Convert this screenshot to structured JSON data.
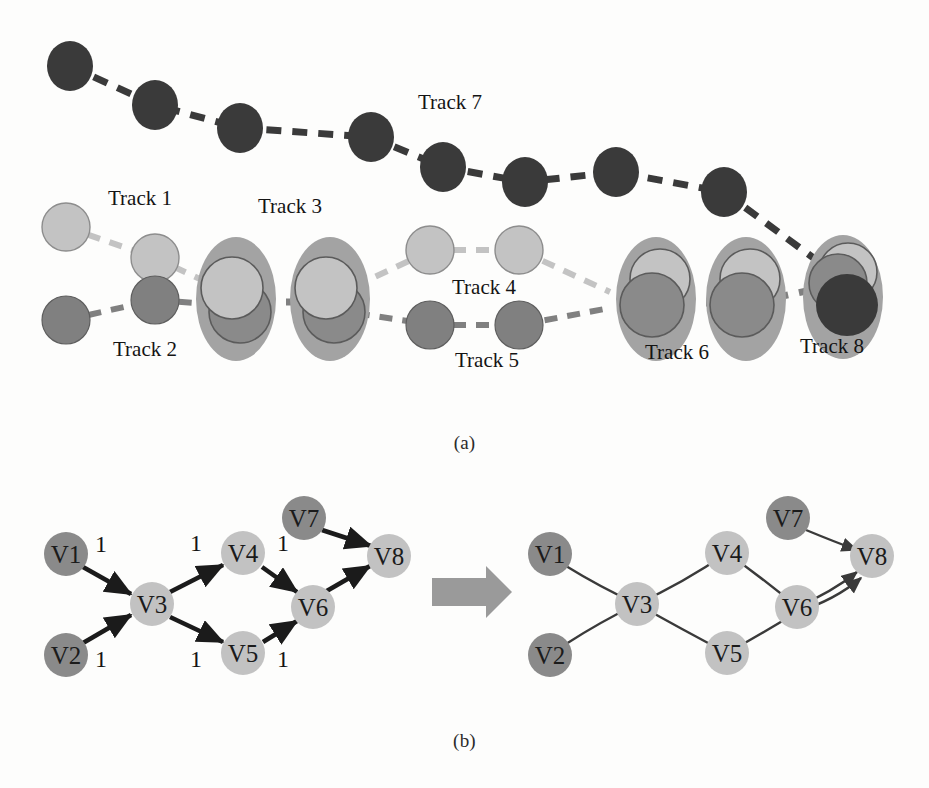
{
  "figure": {
    "panel_a_caption": "(a)",
    "panel_b_caption": "(b)",
    "background_color": "#fdfdfc"
  },
  "colors": {
    "track_dark": "#3a3a3a",
    "track_medium": "#808080",
    "track_light": "#c3c3c3",
    "group_ellipse": "#a0a0a0",
    "node_dark": "#8a8a8a",
    "node_light": "#c2c2c2",
    "edge_black": "#1b1b1b",
    "arrow_block": "#9a9a9a",
    "outline": "#555555"
  },
  "panel_a": {
    "labels": [
      {
        "text": "Track 1",
        "x": 108,
        "y": 186
      },
      {
        "text": "Track 2",
        "x": 113,
        "y": 337
      },
      {
        "text": "Track 3",
        "x": 258,
        "y": 194
      },
      {
        "text": "Track 4",
        "x": 452,
        "y": 275
      },
      {
        "text": "Track 5",
        "x": 455,
        "y": 348
      },
      {
        "text": "Track 6",
        "x": 645,
        "y": 340
      },
      {
        "text": "Track 7",
        "x": 418,
        "y": 90
      },
      {
        "text": "Track 8",
        "x": 800,
        "y": 334
      }
    ],
    "track7": {
      "name": "Track 7",
      "color": "#3a3a3a",
      "points": [
        [
          70,
          66
        ],
        [
          155,
          105
        ],
        [
          240,
          128
        ],
        [
          371,
          137
        ],
        [
          443,
          167
        ],
        [
          525,
          182
        ],
        [
          616,
          172
        ],
        [
          724,
          192
        ],
        [
          838,
          276
        ]
      ]
    },
    "track1": {
      "name": "Track 1",
      "color": "#c3c3c3",
      "points": [
        [
          66,
          227
        ],
        [
          155,
          258
        ],
        [
          236,
          292
        ]
      ]
    },
    "track2": {
      "name": "Track 2",
      "color": "#808080",
      "points": [
        [
          66,
          320
        ],
        [
          155,
          300
        ],
        [
          236,
          306
        ]
      ]
    },
    "track3": {
      "name": "Track 3",
      "merged_centers": [
        [
          236,
          299
        ],
        [
          330,
          299
        ]
      ]
    },
    "track4": {
      "name": "Track 4",
      "color": "#c3c3c3",
      "points": [
        [
          430,
          250
        ],
        [
          519,
          250
        ],
        [
          607,
          287
        ]
      ]
    },
    "track5": {
      "name": "Track 5",
      "color": "#808080",
      "points": [
        [
          430,
          325
        ],
        [
          519,
          325
        ],
        [
          607,
          305
        ]
      ]
    },
    "track6": {
      "name": "Track 6",
      "merged_centers": [
        [
          656,
          299
        ],
        [
          746,
          299
        ]
      ]
    },
    "track8": {
      "name": "Track 8",
      "merged_centers": [
        [
          843,
          297
        ]
      ]
    }
  },
  "panel_b": {
    "left_graph": {
      "nodes": [
        {
          "id": "V1",
          "label": "V1",
          "x": 66,
          "y": 554,
          "tone": "dark"
        },
        {
          "id": "V2",
          "label": "V2",
          "x": 66,
          "y": 655,
          "tone": "dark"
        },
        {
          "id": "V3",
          "label": "V3",
          "x": 152,
          "y": 604,
          "tone": "light"
        },
        {
          "id": "V4",
          "label": "V4",
          "x": 243,
          "y": 553,
          "tone": "light"
        },
        {
          "id": "V5",
          "label": "V5",
          "x": 243,
          "y": 653,
          "tone": "light"
        },
        {
          "id": "V6",
          "label": "V6",
          "x": 313,
          "y": 607,
          "tone": "light"
        },
        {
          "id": "V7",
          "label": "V7",
          "x": 304,
          "y": 518,
          "tone": "dark"
        },
        {
          "id": "V8",
          "label": "V8",
          "x": 389,
          "y": 556,
          "tone": "light"
        }
      ],
      "edges": [
        {
          "from": "V1",
          "to": "V3",
          "weight": "1",
          "wx": 101,
          "wy": 552
        },
        {
          "from": "V2",
          "to": "V3",
          "weight": "1",
          "wx": 101,
          "wy": 667
        },
        {
          "from": "V3",
          "to": "V4",
          "weight": "1",
          "wx": 196,
          "wy": 551
        },
        {
          "from": "V3",
          "to": "V5",
          "weight": "1",
          "wx": 196,
          "wy": 667
        },
        {
          "from": "V4",
          "to": "V6",
          "weight": "1",
          "wx": 283,
          "wy": 551
        },
        {
          "from": "V5",
          "to": "V6",
          "weight": "1",
          "wx": 283,
          "wy": 667
        },
        {
          "from": "V7",
          "to": "V8",
          "weight": "",
          "wx": 0,
          "wy": 0
        },
        {
          "from": "V6",
          "to": "V8",
          "weight": "",
          "wx": 0,
          "wy": 0
        }
      ]
    },
    "transition_arrow": {
      "name": "merge-arrow",
      "x": 460,
      "y": 590
    },
    "right_graph": {
      "nodes": [
        {
          "id": "V1",
          "label": "V1",
          "x": 550,
          "y": 554,
          "tone": "dark"
        },
        {
          "id": "V2",
          "label": "V2",
          "x": 550,
          "y": 655,
          "tone": "dark"
        },
        {
          "id": "V3",
          "label": "V3",
          "x": 637,
          "y": 604,
          "tone": "light"
        },
        {
          "id": "V4",
          "label": "V4",
          "x": 727,
          "y": 553,
          "tone": "light"
        },
        {
          "id": "V5",
          "label": "V5",
          "x": 727,
          "y": 653,
          "tone": "light"
        },
        {
          "id": "V6",
          "label": "V6",
          "x": 797,
          "y": 607,
          "tone": "light"
        },
        {
          "id": "V7",
          "label": "V7",
          "x": 788,
          "y": 518,
          "tone": "dark"
        },
        {
          "id": "V8",
          "label": "V8",
          "x": 872,
          "y": 556,
          "tone": "light"
        }
      ],
      "paths": [
        {
          "name": "trajectory-upper",
          "sequence": [
            "V1",
            "V3",
            "V4",
            "V6",
            "V8"
          ]
        },
        {
          "name": "trajectory-lower",
          "sequence": [
            "V2",
            "V3",
            "V5",
            "V6",
            "V8"
          ]
        },
        {
          "name": "trajectory-v7",
          "sequence": [
            "V7",
            "V8"
          ]
        }
      ]
    }
  }
}
